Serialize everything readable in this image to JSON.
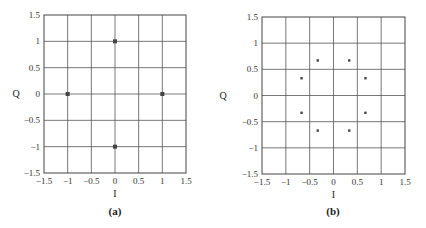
{
  "chart_data": [
    {
      "type": "scatter",
      "panel_label": "(a)",
      "title": "",
      "xlabel": "I",
      "ylabel": "Q",
      "xlim": [
        -1.5,
        1.5
      ],
      "ylim": [
        -1.5,
        1.5
      ],
      "xticks": [
        "-1.5",
        "-1",
        "-0.5",
        "0",
        "0.5",
        "1",
        "1.5"
      ],
      "yticks": [
        "1.5",
        "1",
        "0.5",
        "0",
        "-0.5",
        "-1",
        "-1.5"
      ],
      "grid": true,
      "points": [
        {
          "x": 0,
          "y": 1
        },
        {
          "x": -1,
          "y": 0
        },
        {
          "x": 1,
          "y": 0
        },
        {
          "x": 0,
          "y": -1
        }
      ],
      "marker": "square-dot",
      "marker_color": "#444444"
    },
    {
      "type": "scatter",
      "panel_label": "(b)",
      "title": "",
      "xlabel": "I",
      "ylabel": "Q",
      "xlim": [
        -1.5,
        1.5
      ],
      "ylim": [
        -1.5,
        1.5
      ],
      "xticks": [
        "-1.5",
        "-1",
        "-0.5",
        "0",
        "0.5",
        "1",
        "1.5"
      ],
      "yticks": [
        "1.5",
        "1",
        "0.5",
        "0",
        "-0.5",
        "-1",
        "-1.5"
      ],
      "grid": true,
      "points": [
        {
          "x": -0.33,
          "y": 0.67
        },
        {
          "x": 0.33,
          "y": 0.67
        },
        {
          "x": -0.67,
          "y": 0.33
        },
        {
          "x": 0.67,
          "y": 0.33
        },
        {
          "x": -0.67,
          "y": -0.33
        },
        {
          "x": 0.67,
          "y": -0.33
        },
        {
          "x": -0.33,
          "y": -0.67
        },
        {
          "x": 0.33,
          "y": -0.67
        }
      ],
      "marker": "small-dot",
      "marker_color": "#444444"
    }
  ],
  "panels": [
    {
      "caption": "(a)",
      "xlabel": "I",
      "ylabel": "Q"
    },
    {
      "caption": "(b)",
      "xlabel": "I",
      "ylabel": "Q"
    }
  ],
  "colors": {
    "grid": "#555555",
    "frame": "#444444",
    "marker": "#444444"
  }
}
